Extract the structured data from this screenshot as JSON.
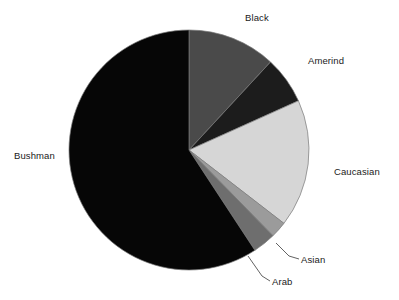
{
  "chart_data": {
    "type": "pie",
    "title": "",
    "subtitle": "",
    "xlabel": "",
    "ylabel": "",
    "grid": false,
    "legend_position": "outside-labels",
    "start_angle_deg": 0,
    "direction": "clockwise",
    "center": {
      "x": 189,
      "y": 150
    },
    "radius": 120,
    "categories": [
      "Black",
      "Amerind",
      "Caucasian",
      "Asian",
      "Arab",
      "Bushman"
    ],
    "values": [
      11.9,
      6.4,
      17.2,
      2.2,
      3.1,
      59.2
    ],
    "slices": [
      {
        "label": "Black",
        "value": 11.9,
        "start_deg": 0.0,
        "end_deg": 42.8,
        "color": "#4a4a4a"
      },
      {
        "label": "Amerind",
        "value": 6.4,
        "start_deg": 42.8,
        "end_deg": 65.8,
        "color": "#1c1c1c"
      },
      {
        "label": "Caucasian",
        "value": 17.2,
        "start_deg": 65.8,
        "end_deg": 127.7,
        "color": "#d6d6d6"
      },
      {
        "label": "Asian",
        "value": 2.2,
        "start_deg": 127.7,
        "end_deg": 135.6,
        "color": "#9b9b9b"
      },
      {
        "label": "Arab",
        "value": 3.1,
        "start_deg": 135.6,
        "end_deg": 146.7,
        "color": "#6e6e6e"
      },
      {
        "label": "Bushman",
        "value": 59.2,
        "start_deg": 146.7,
        "end_deg": 360.0,
        "color": "#060606"
      }
    ],
    "outline_color": "#7a7a7a",
    "background_color": "#ffffff",
    "label_color": "#1a1a1a"
  },
  "labels": {
    "black": "Black",
    "amerind": "Amerind",
    "caucasian": "Caucasian",
    "asian": "Asian",
    "arab": "Arab",
    "bushman": "Bushman"
  }
}
